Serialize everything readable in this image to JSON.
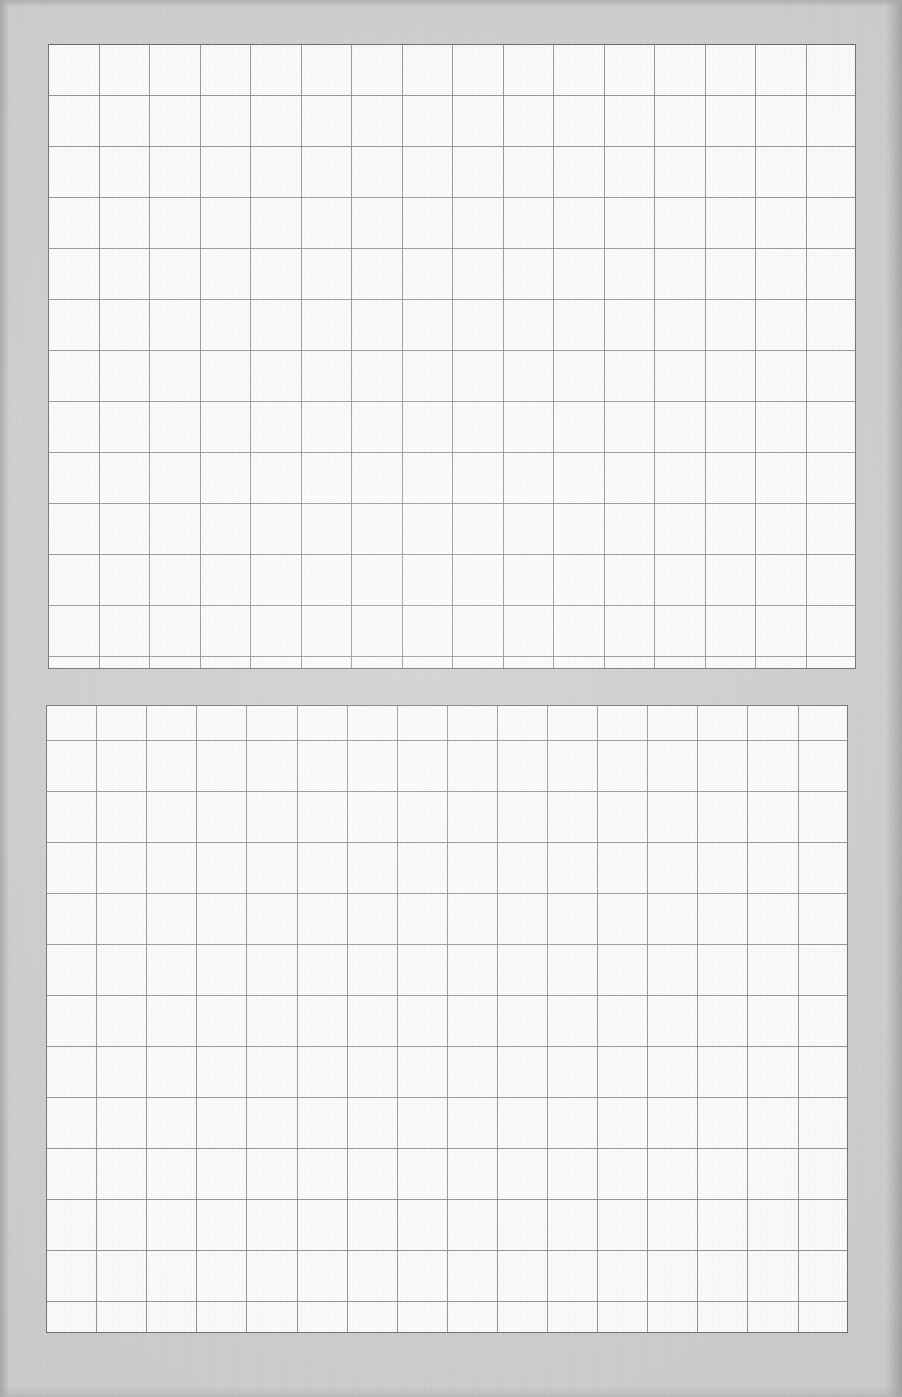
{
  "document": {
    "type": "scanned-blank-grid-worksheet",
    "page_background_color": "#cfcfcf",
    "paper_color": "#ffffff",
    "grid_line_color": "#7d7d7d",
    "border_line_color": "#6a6a6a",
    "width_px": 902,
    "height_px": 1397,
    "visible_text": "",
    "notes": "No printed text, labels, headings, numbers or marks are present; the page shows two empty ruled grid tables on a gray scan background."
  },
  "tables": [
    {
      "id": "grid-table-top",
      "label": "Upper blank grid table",
      "x": 48,
      "y": 44,
      "width": 808,
      "height": 625,
      "columns": 16,
      "rows": 12,
      "cell_width": 50.5,
      "cell_height": 51,
      "first_row_partial": false,
      "last_row_partial": true,
      "cells_filled": 0,
      "content": ""
    },
    {
      "id": "grid-table-bottom",
      "label": "Lower blank grid table",
      "x": 46,
      "y": 705,
      "width": 802,
      "height": 628,
      "columns": 16,
      "rows": 13,
      "cell_width": 50.1,
      "cell_height": 51,
      "first_row_partial": true,
      "last_row_partial": true,
      "cells_filled": 0,
      "content": ""
    }
  ],
  "gap": {
    "label": "Gray separator band between the two grid tables",
    "y": 669,
    "height": 36,
    "color": "#cbcbcb"
  },
  "margins": {
    "left_px": 48,
    "right_px": 46,
    "top_px": 44,
    "bottom_px": 65,
    "left_edge_shade": "#a9a9a9",
    "right_edge_shade": "#a6a6a6"
  }
}
